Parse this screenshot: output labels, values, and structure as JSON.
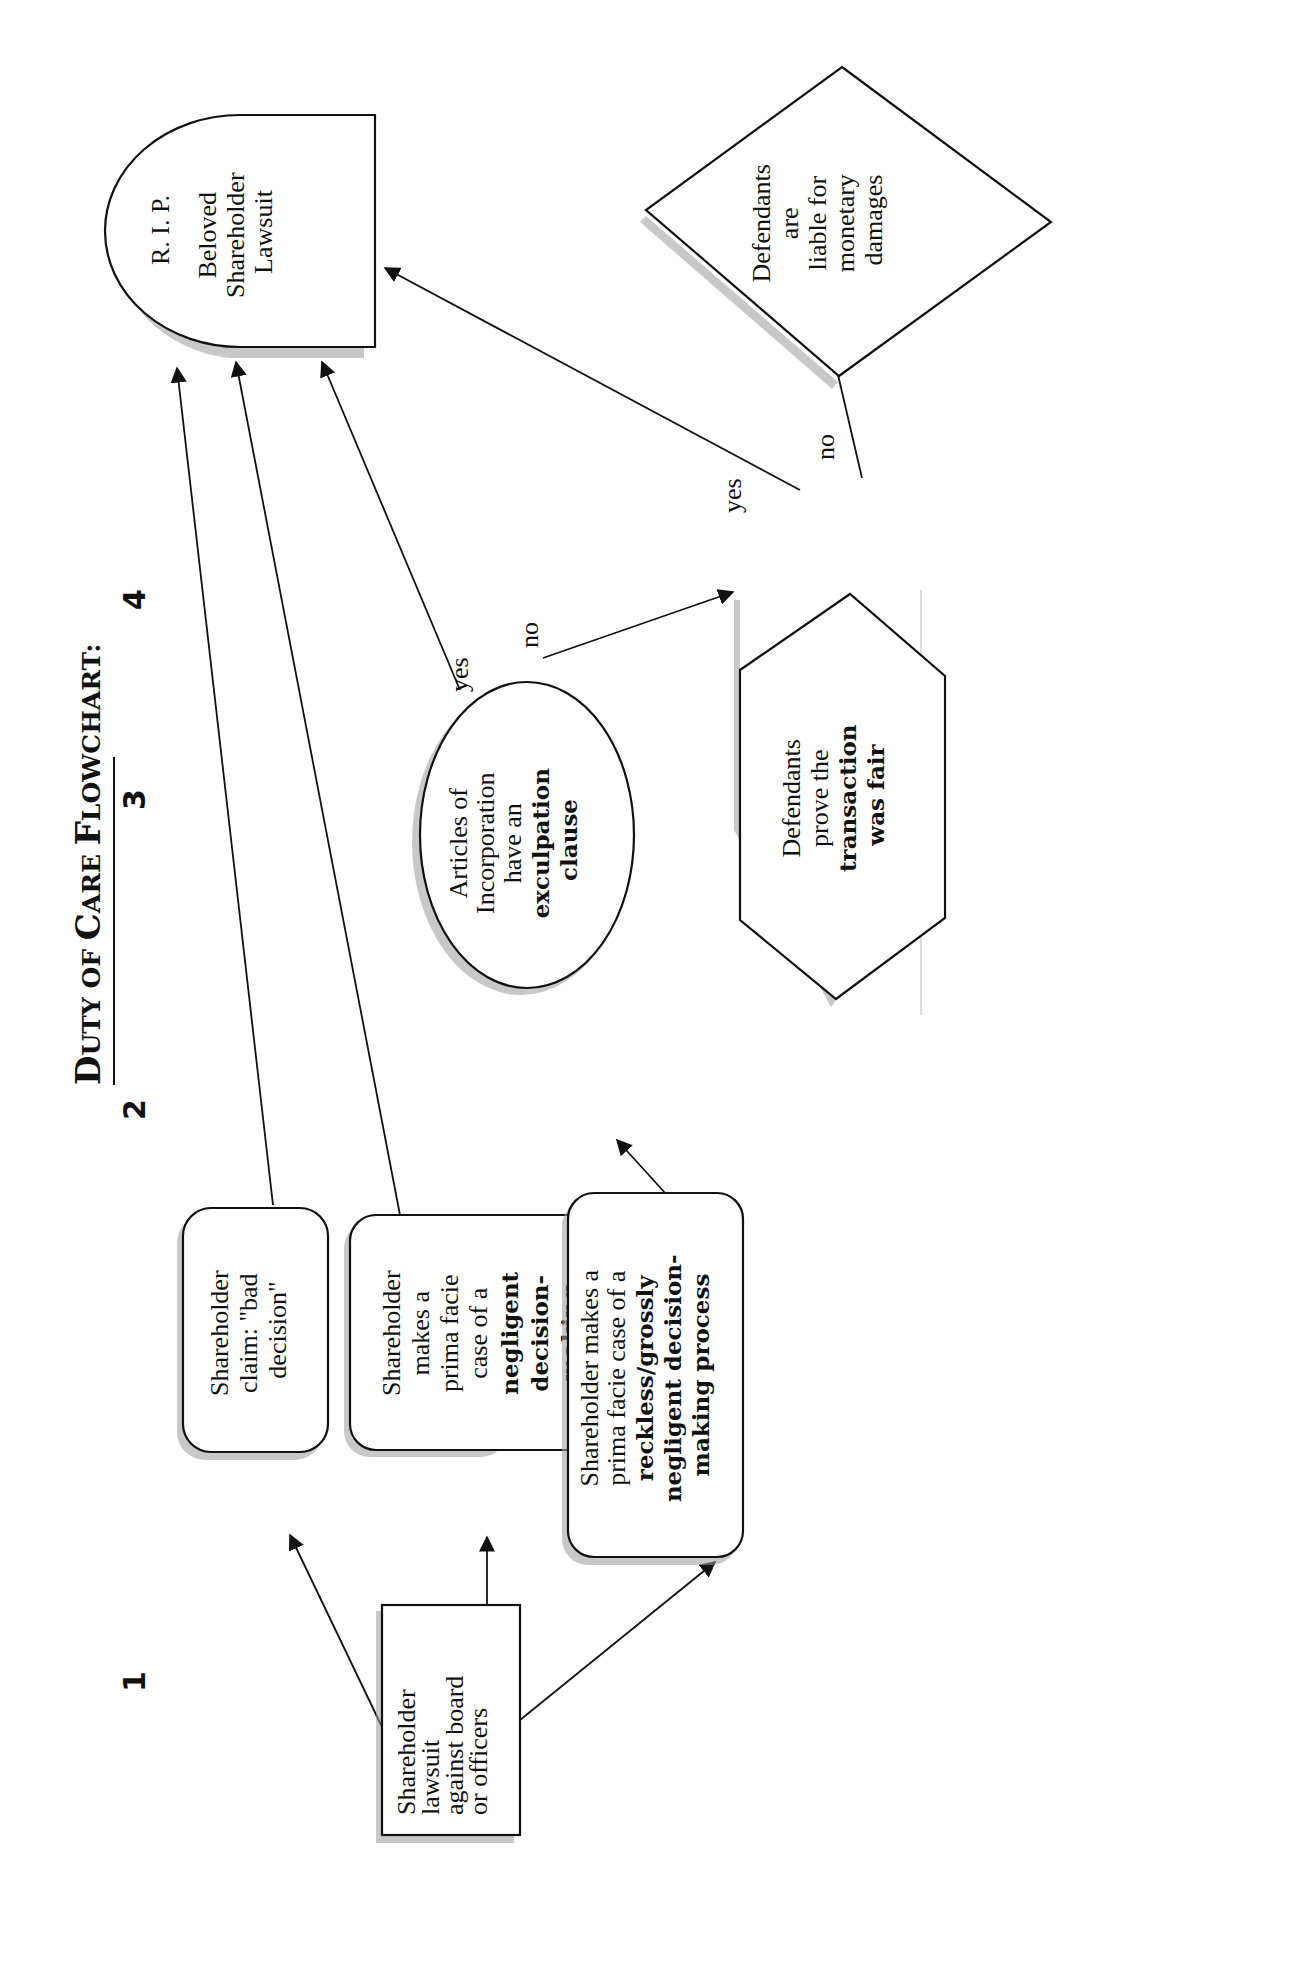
{
  "title": {
    "prefix_big_D": "D",
    "prefix_rest": "UTY OF ",
    "big_C": "C",
    "rest_C": "ARE ",
    "big_F": "F",
    "rest_F": "LOWCHART:",
    "full": "Duty of Care Flowchart:"
  },
  "columns": [
    {
      "label": "1"
    },
    {
      "label": "2"
    },
    {
      "label": "3"
    },
    {
      "label": "4"
    }
  ],
  "nodes": {
    "start": {
      "lines": [
        "Shareholder",
        "lawsuit",
        "against board",
        "or officers"
      ]
    },
    "bad_decision": {
      "lines": [
        "Shareholder",
        "claim:  \"bad",
        "decision\""
      ]
    },
    "negligent": {
      "lines": [
        "Shareholder",
        "makes a",
        "prima facie",
        "case of a"
      ],
      "bold_lines": [
        "negligent",
        "decision-",
        "making",
        "process"
      ]
    },
    "reckless": {
      "lines": [
        "Shareholder makes a",
        "prima facie case of a"
      ],
      "bold_lines": [
        "reckless/grossly",
        "negligent decision-",
        "making process"
      ]
    },
    "exculpation": {
      "lines": [
        "Articles of",
        "Incorporation",
        "have an"
      ],
      "bold_lines": [
        "exculpation",
        "clause"
      ]
    },
    "fairness": {
      "lines": [
        "Defendants",
        "prove the"
      ],
      "bold_lines": [
        "transaction",
        "was fair"
      ]
    },
    "rip": {
      "line1": "R. I. P.",
      "lines": [
        "Beloved",
        "Shareholder",
        "Lawsuit"
      ]
    },
    "liable": {
      "lines": [
        "Defendants",
        "are",
        "liable for",
        "monetary",
        "damages"
      ]
    }
  },
  "edge_labels": {
    "exculpation_yes": "yes",
    "exculpation_no": "no",
    "fairness_yes": "yes",
    "fairness_no": "no"
  }
}
